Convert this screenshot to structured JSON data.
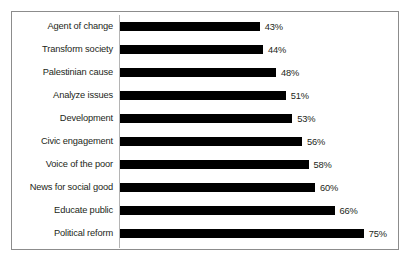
{
  "chart_data": {
    "type": "bar",
    "orientation": "horizontal",
    "title": "",
    "subtitle": "",
    "xlabel": "",
    "ylabel": "",
    "xlim": [
      0,
      80
    ],
    "grid": false,
    "legend": null,
    "value_labels_suffix": "%",
    "bar_color": "#000000",
    "axis_line_color": "#b4b4b4",
    "border_color": "#8c8c8c",
    "text_color": "#231f20",
    "categories": [
      "Agent of change",
      "Transform society",
      "Palestinian cause",
      "Analyze issues",
      "Development",
      "Civic engagement",
      "Voice of the poor",
      "News for social good",
      "Educate public",
      "Political reform"
    ],
    "values": [
      43,
      44,
      48,
      51,
      53,
      56,
      58,
      60,
      66,
      75
    ],
    "value_labels": [
      "43%",
      "44%",
      "48%",
      "51%",
      "53%",
      "56%",
      "58%",
      "60%",
      "66%",
      "75%"
    ]
  }
}
